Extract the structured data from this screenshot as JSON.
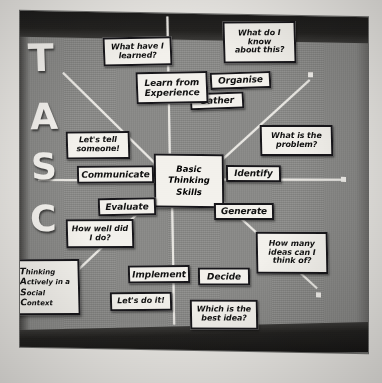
{
  "photo": {
    "subject": "TASC wheel classroom display board",
    "board_color": "#8b8b89",
    "card_color": "#f3f1ec",
    "spoke_color": "#e9e7e2",
    "frame_color": "#1d1c1b"
  },
  "hub": {
    "lines": [
      "Basic",
      "Thinking",
      "Skills"
    ]
  },
  "acronym_letters": [
    "T",
    "A",
    "S",
    "C"
  ],
  "acronym_card": {
    "lines": [
      {
        "initial": "T",
        "rest": "hinking"
      },
      {
        "initial": "A",
        "rest": "ctively in a"
      },
      {
        "initial": "S",
        "rest": "ocial"
      },
      {
        "initial": "C",
        "rest": "ontext"
      }
    ]
  },
  "stage_cards": [
    {
      "id": "gather",
      "label": "Gather"
    },
    {
      "id": "identify",
      "label": "Identify"
    },
    {
      "id": "generate",
      "label": "Generate"
    },
    {
      "id": "decide",
      "label": "Decide"
    },
    {
      "id": "implement",
      "label": "Implement"
    },
    {
      "id": "evaluate",
      "label": "Evaluate"
    },
    {
      "id": "communicate",
      "label": "Communicate"
    },
    {
      "id": "organise",
      "label": "Organise"
    }
  ],
  "question_cards": [
    {
      "id": "what-do-i-know",
      "lines": [
        "What do I",
        "know",
        "about this?"
      ]
    },
    {
      "id": "what-is-the-problem",
      "lines": [
        "What is the",
        "problem?"
      ]
    },
    {
      "id": "how-many-ideas",
      "lines": [
        "How many",
        "ideas can I",
        "think of?"
      ]
    },
    {
      "id": "which-is-best-idea",
      "lines": [
        "Which is the",
        "best idea?"
      ]
    },
    {
      "id": "lets-do-it",
      "lines": [
        "Let's do it!"
      ]
    },
    {
      "id": "how-well-did-i-do",
      "lines": [
        "How well did",
        "I do?"
      ]
    },
    {
      "id": "lets-tell-someone",
      "lines": [
        "Let's tell",
        "someone!"
      ]
    },
    {
      "id": "what-have-i-learned",
      "lines": [
        "What have I",
        "learned?"
      ]
    },
    {
      "id": "learn-from-experience",
      "lines": [
        "Learn from",
        "Experience"
      ]
    }
  ]
}
